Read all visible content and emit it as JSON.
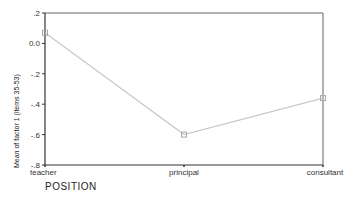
{
  "chart_data": {
    "type": "line",
    "title": "",
    "xlabel": "POSITION",
    "ylabel": "Mean of factor 1 (items 35-53)",
    "categories": [
      "teacher",
      "principal",
      "consultant"
    ],
    "series": [
      {
        "name": "Mean of factor 1",
        "values": [
          0.07,
          -0.6,
          -0.36
        ]
      }
    ],
    "ylim": [
      -0.8,
      0.2
    ],
    "yticks": [
      0.2,
      0.0,
      -0.2,
      -0.4,
      -0.6,
      -0.8
    ],
    "ytick_labels": [
      ".2",
      "0.0",
      "-.2",
      "-.4",
      "-.6",
      "-.8"
    ],
    "grid": false,
    "legend": false,
    "colors": {
      "line": "#c8c8c8",
      "marker": "#a8a8a8",
      "axis": "#333333",
      "frame": "#666666"
    }
  }
}
